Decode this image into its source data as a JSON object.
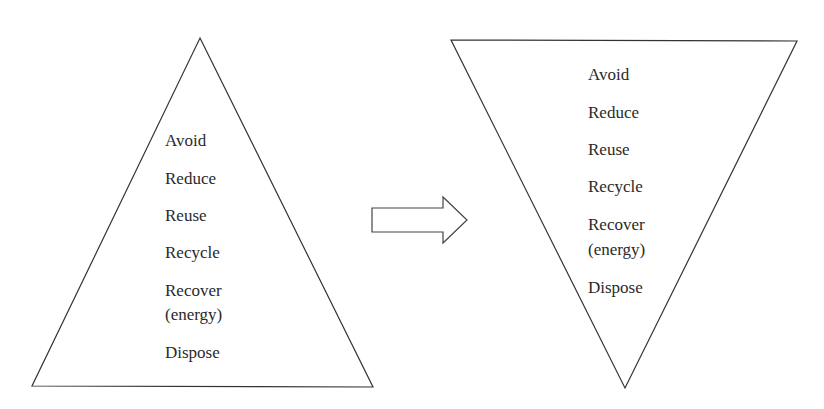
{
  "left_pyramid": {
    "orientation": "upright",
    "items": [
      "Avoid",
      "Reduce",
      "Reuse",
      "Recycle",
      "Recover",
      "(energy)",
      "Dispose"
    ]
  },
  "arrow": {
    "direction": "right"
  },
  "right_pyramid": {
    "orientation": "inverted",
    "items": [
      "Avoid",
      "Reduce",
      "Reuse",
      "Recycle",
      "Recover",
      "(energy)",
      "Dispose"
    ]
  },
  "colors": {
    "stroke": "#333333",
    "text": "#2a2a2a",
    "background": "#ffffff"
  }
}
